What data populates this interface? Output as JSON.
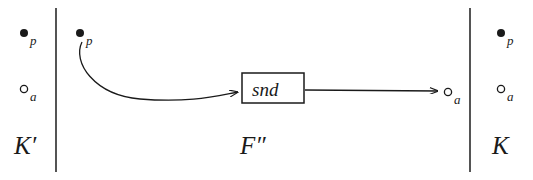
{
  "figure": {
    "background_color": "#ffffff",
    "ink_color": "#1a1a1a",
    "width": 533,
    "height": 180
  },
  "regions": [
    {
      "id": "left",
      "label": "K′",
      "label_x": 14,
      "label_y": 133
    },
    {
      "id": "middle",
      "label": "F″",
      "label_x": 240,
      "label_y": 133
    },
    {
      "id": "right",
      "label": "K",
      "label_x": 492,
      "label_y": 133
    }
  ],
  "dividers": [
    {
      "id": "left-divider",
      "x": 56,
      "y1": 8,
      "y2": 172
    },
    {
      "id": "right-divider",
      "x": 470,
      "y1": 8,
      "y2": 172
    }
  ],
  "nodes": [
    {
      "id": "kprime-p",
      "kind": "filled",
      "subscript": "p",
      "cx": 24,
      "cy": 33,
      "r": 4.0
    },
    {
      "id": "kprime-a",
      "kind": "open",
      "subscript": "a",
      "cx": 24,
      "cy": 89,
      "r": 4.0
    },
    {
      "id": "fsec-p",
      "kind": "filled",
      "subscript": "p",
      "cx": 80,
      "cy": 33,
      "r": 4.0
    },
    {
      "id": "fsec-a",
      "kind": "open",
      "subscript": "a",
      "cx": 448,
      "cy": 92,
      "r": 4.0
    },
    {
      "id": "k-p",
      "kind": "filled",
      "subscript": "p",
      "cx": 501,
      "cy": 33,
      "r": 4.0
    },
    {
      "id": "k-a",
      "kind": "open",
      "subscript": "a",
      "cx": 501,
      "cy": 89,
      "r": 4.0
    }
  ],
  "box": {
    "id": "snd-box",
    "label": "snd",
    "x": 242,
    "y": 73,
    "width": 62,
    "height": 30
  },
  "edges": [
    {
      "id": "curved-edge",
      "from": "fsec-p",
      "to": "snd-box",
      "path": "M 82 42 C 72 62, 94 95, 140 99 C 190 103, 216 96, 238 92",
      "arrow": true
    },
    {
      "id": "straight-edge",
      "from": "snd-box",
      "to": "fsec-a",
      "path": "M 305 90 L 438 91",
      "arrow": true
    }
  ]
}
